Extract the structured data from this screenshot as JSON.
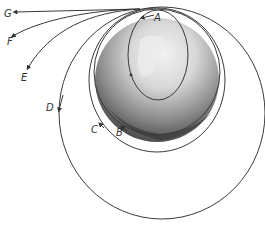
{
  "diagram": {
    "labels": {
      "A": "A",
      "B": "B",
      "C": "C",
      "D": "D",
      "E": "E",
      "F": "F",
      "G": "G"
    },
    "colors": {
      "line": "#3a3a3a",
      "background": "#ffffff"
    }
  }
}
